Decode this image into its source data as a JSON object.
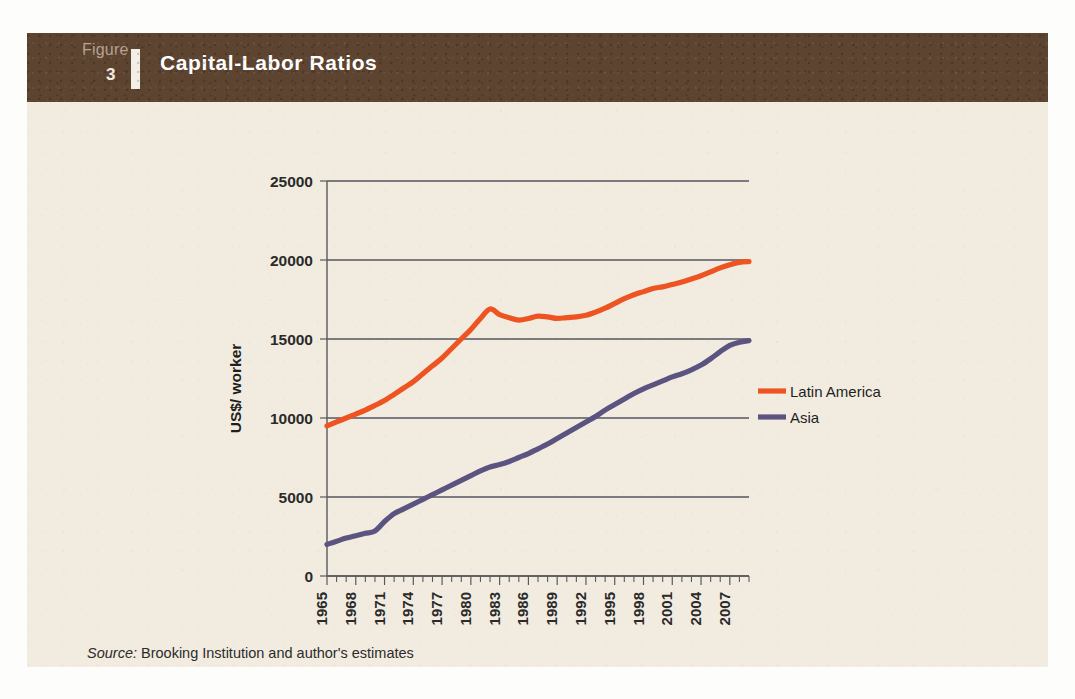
{
  "figure": {
    "label_word": "Figure",
    "number": "3",
    "title": "Capital-Labor Ratios",
    "source_prefix": "Source:",
    "source_text": "Brooking Institution and author's estimates"
  },
  "colors": {
    "header_band": "#5D4431",
    "card_background": "#F2ECE0",
    "page_background": "#FDFDFB",
    "latin_america": "#EE5322",
    "asia": "#5B5480",
    "grid": "#565663",
    "axis": "#5A5A5A"
  },
  "chart_data": {
    "type": "line",
    "title": "Capital-Labor Ratios",
    "xlabel": "",
    "ylabel": "US$/ worker",
    "xlim": [
      1965,
      2009
    ],
    "ylim": [
      0,
      25000
    ],
    "grid": true,
    "legend_position": "right",
    "ytick_labels": [
      "0",
      "5000",
      "10000",
      "15000",
      "20000",
      "25000"
    ],
    "yticks": [
      0,
      5000,
      10000,
      15000,
      20000,
      25000
    ],
    "xtick_labels": [
      "1965",
      "1968",
      "1971",
      "1974",
      "1977",
      "1980",
      "1983",
      "1986",
      "1989",
      "1992",
      "1995",
      "1998",
      "2001",
      "2004",
      "2007"
    ],
    "xticks": [
      1965,
      1968,
      1971,
      1974,
      1977,
      1980,
      1983,
      1986,
      1989,
      1992,
      1995,
      1998,
      2001,
      2004,
      2007
    ],
    "x": [
      1965,
      1966,
      1967,
      1968,
      1969,
      1970,
      1971,
      1972,
      1973,
      1974,
      1975,
      1976,
      1977,
      1978,
      1979,
      1980,
      1981,
      1982,
      1983,
      1984,
      1985,
      1986,
      1987,
      1988,
      1989,
      1990,
      1991,
      1992,
      1993,
      1994,
      1995,
      1996,
      1997,
      1998,
      1999,
      2000,
      2001,
      2002,
      2003,
      2004,
      2005,
      2006,
      2007,
      2008,
      2009
    ],
    "series": [
      {
        "name": "Latin America",
        "color": "#EE5322",
        "values": [
          9500,
          9750,
          10000,
          10250,
          10500,
          10800,
          11100,
          11500,
          11900,
          12300,
          12800,
          13300,
          13800,
          14400,
          15000,
          15600,
          16300,
          16900,
          16550,
          16350,
          16200,
          16300,
          16450,
          16400,
          16300,
          16350,
          16400,
          16500,
          16700,
          16950,
          17250,
          17550,
          17800,
          18000,
          18200,
          18300,
          18450,
          18600,
          18800,
          19000,
          19250,
          19500,
          19700,
          19850,
          19900
        ]
      },
      {
        "name": "Asia",
        "color": "#5B5480",
        "values": [
          2000,
          2200,
          2400,
          2550,
          2700,
          2850,
          3450,
          3950,
          4250,
          4550,
          4850,
          5150,
          5450,
          5750,
          6050,
          6350,
          6650,
          6900,
          7050,
          7250,
          7500,
          7750,
          8050,
          8350,
          8700,
          9050,
          9400,
          9750,
          10100,
          10500,
          10850,
          11200,
          11550,
          11850,
          12100,
          12350,
          12600,
          12800,
          13050,
          13350,
          13750,
          14200,
          14600,
          14800,
          14900
        ]
      }
    ]
  },
  "legend": [
    {
      "label": "Latin America",
      "color": "#EE5322"
    },
    {
      "label": "Asia",
      "color": "#5B5480"
    }
  ]
}
